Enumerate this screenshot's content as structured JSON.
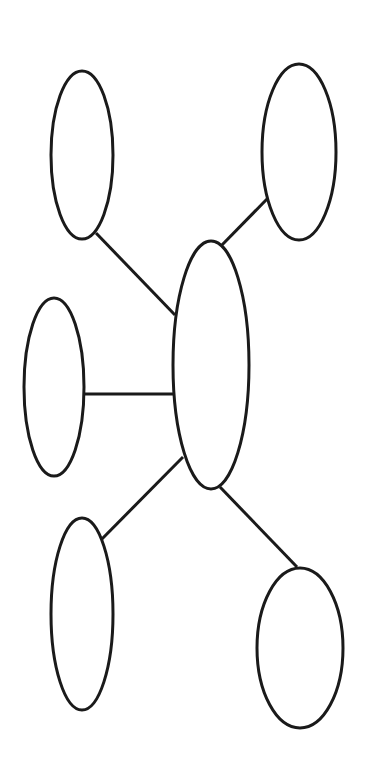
{
  "diagram": {
    "type": "bubble-map",
    "stroke_color": "#1a1a1a",
    "background": "#ffffff",
    "center_node": {
      "id": "center",
      "label": "",
      "cx": 211,
      "cy": 365,
      "rx": 38,
      "ry": 124
    },
    "nodes": [
      {
        "id": "top-left",
        "label": "",
        "cx": 82,
        "cy": 155,
        "rx": 31,
        "ry": 84
      },
      {
        "id": "top-right",
        "label": "",
        "cx": 299,
        "cy": 152,
        "rx": 37,
        "ry": 88
      },
      {
        "id": "middle-left",
        "label": "",
        "cx": 54,
        "cy": 387,
        "rx": 30,
        "ry": 89
      },
      {
        "id": "bottom-left",
        "label": "",
        "cx": 82,
        "cy": 614,
        "rx": 31,
        "ry": 96
      },
      {
        "id": "bottom-right",
        "label": "",
        "cx": 300,
        "cy": 648,
        "rx": 43,
        "ry": 80
      }
    ],
    "edges": [
      {
        "from": "center",
        "to": "top-left",
        "x1": 175,
        "y1": 315,
        "x2": 96,
        "y2": 233
      },
      {
        "from": "center",
        "to": "top-right",
        "x1": 220,
        "y1": 247,
        "x2": 267,
        "y2": 199
      },
      {
        "from": "center",
        "to": "middle-left",
        "x1": 173,
        "y1": 394,
        "x2": 84,
        "y2": 394
      },
      {
        "from": "center",
        "to": "bottom-left",
        "x1": 183,
        "y1": 457,
        "x2": 96,
        "y2": 545
      },
      {
        "from": "center",
        "to": "bottom-right",
        "x1": 220,
        "y1": 487,
        "x2": 297,
        "y2": 567
      }
    ]
  }
}
